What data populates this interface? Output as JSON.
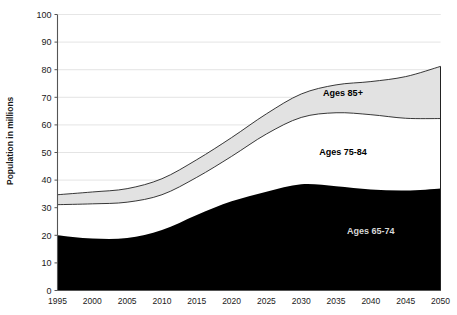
{
  "chart_data": {
    "type": "area",
    "stacked": true,
    "title": "",
    "subtitle": "",
    "xlabel": "",
    "ylabel": "Population in millions",
    "x": [
      1995,
      2000,
      2005,
      2010,
      2015,
      2020,
      2025,
      2030,
      2035,
      2040,
      2045,
      2050
    ],
    "categories": [
      "1995",
      "2000",
      "2005",
      "2010",
      "2015",
      "2020",
      "2025",
      "2030",
      "2035",
      "2040",
      "2045",
      "2050"
    ],
    "xlim": [
      1995,
      2050
    ],
    "ylim": [
      0,
      100
    ],
    "y_ticks": [
      0,
      10,
      20,
      30,
      40,
      50,
      60,
      70,
      80,
      90,
      100
    ],
    "x_ticks": [
      "1995",
      "2000",
      "2005",
      "2010",
      "2015",
      "2020",
      "2025",
      "2030",
      "2035",
      "2040",
      "2045",
      "2050"
    ],
    "grid": true,
    "legend": "inline-annotations",
    "series": [
      {
        "name": "Ages 65-74",
        "fill": "#000000",
        "values": [
          20.0,
          18.8,
          19.0,
          21.9,
          27.4,
          32.3,
          35.8,
          38.5,
          37.8,
          36.6,
          36.2,
          37.0
        ]
      },
      {
        "name": "Ages 75-84",
        "fill": "#ffffff",
        "values": [
          11.1,
          12.6,
          13.0,
          12.8,
          13.6,
          16.3,
          20.9,
          24.2,
          26.6,
          27.1,
          26.2,
          25.3
        ]
      },
      {
        "name": "Ages 85+",
        "fill": "#e2e2e2",
        "values": [
          3.6,
          4.3,
          4.9,
          5.8,
          6.4,
          6.8,
          7.3,
          8.5,
          10.1,
          12.0,
          15.1,
          18.9
        ]
      }
    ],
    "cumulative": {
      "ages_65_74_top": [
        20.0,
        18.8,
        19.0,
        21.9,
        27.4,
        32.3,
        35.8,
        38.5,
        37.8,
        36.6,
        36.2,
        37.0
      ],
      "ages_75_84_top": [
        31.1,
        31.4,
        32.0,
        34.7,
        41.0,
        48.6,
        56.7,
        62.7,
        64.4,
        63.7,
        62.4,
        62.3
      ],
      "ages_85_plus_top": [
        34.7,
        35.7,
        36.9,
        40.5,
        47.4,
        55.4,
        64.0,
        71.2,
        74.5,
        75.7,
        77.5,
        81.2
      ]
    },
    "annotations": [
      {
        "name": "Ages 85+",
        "text": "Ages 85+",
        "x": 2036,
        "y": 70.5,
        "style": "bold-dark"
      },
      {
        "name": "Ages 75-84",
        "text": "Ages 75-84",
        "x": 2036,
        "y": 49.0,
        "style": "bold-dark"
      },
      {
        "name": "Ages 65-74",
        "text": "Ages 65-74",
        "x": 2040,
        "y": 20.5,
        "style": "bold-light"
      }
    ]
  },
  "axes": {
    "y_title": "Population in millions"
  }
}
